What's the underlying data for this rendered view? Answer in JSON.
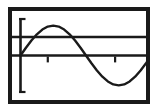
{
  "figure": {
    "title": "",
    "frame_color": "#1a1a1a",
    "background_color": "#ffffff",
    "curve_color": "#1a1a1a",
    "axis_color": "#1a1a1a"
  },
  "chart_data": {
    "type": "line",
    "title": "",
    "xlabel": "",
    "ylabel": "",
    "xlim": [
      0,
      360
    ],
    "ylim": [
      -1.35,
      1.35
    ],
    "grid": false,
    "legend": null,
    "axes": {
      "y_axis": {
        "name": "y-axis",
        "x_position": 0,
        "y_from": 1.25,
        "y_to": -1.25,
        "end_caps": true
      },
      "x_axis": {
        "name": "x-axis",
        "y_position": 0,
        "x_from": 0,
        "x_to": 360,
        "tick_values": [
          75,
          260
        ],
        "tick_labels": [
          "",
          ""
        ]
      }
    },
    "reference_lines": [
      {
        "name": "horizontal-reference-line",
        "orientation": "horizontal",
        "y_value": 0.62,
        "x_from": 0,
        "x_to": 360
      }
    ],
    "series": [
      {
        "name": "sine",
        "function": "y = sin(x)",
        "amplitude": 1.0,
        "period": 360,
        "phase": 0,
        "x": [
          0,
          15,
          30,
          45,
          60,
          75,
          90,
          105,
          120,
          135,
          150,
          165,
          180,
          195,
          210,
          225,
          240,
          255,
          270,
          285,
          300,
          315,
          330,
          345,
          360
        ],
        "values": [
          0,
          0.26,
          0.5,
          0.71,
          0.87,
          0.97,
          1.0,
          0.97,
          0.87,
          0.71,
          0.5,
          0.26,
          0,
          -0.26,
          -0.5,
          -0.71,
          -0.87,
          -0.97,
          -1.0,
          -0.97,
          -0.87,
          -0.71,
          -0.5,
          -0.26,
          0
        ]
      }
    ],
    "annotations": []
  }
}
